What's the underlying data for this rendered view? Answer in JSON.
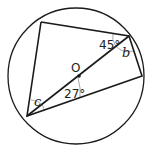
{
  "diagram": {
    "type": "circle-theorem",
    "center_label": "O",
    "angles": [
      {
        "label": "45°",
        "at": "top-right vertex, between top chord and diameter"
      },
      {
        "label": "b",
        "at": "top-right vertex, between diameter and right chord"
      },
      {
        "label": "27°",
        "at": "bottom-left vertex, between diameter and lower chord"
      },
      {
        "label": "c",
        "at": "bottom-left vertex, between left chord and diameter"
      }
    ]
  },
  "labels": {
    "O": "O",
    "a45": "45°",
    "b": "b",
    "a27": "27°",
    "c": "c"
  }
}
